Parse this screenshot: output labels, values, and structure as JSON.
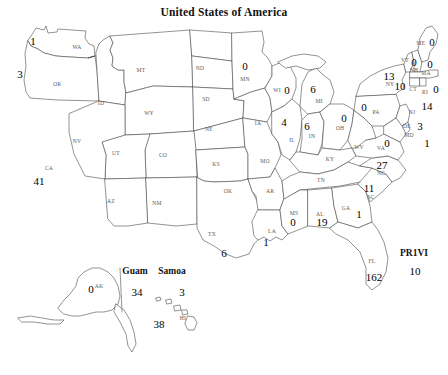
{
  "title": "United States of America",
  "chart_data": {
    "type": "map",
    "title": "United States of America",
    "subtitle": "",
    "xlabel": "",
    "ylabel": "",
    "legend": "none",
    "grid": false,
    "region_field": "state_abbreviation",
    "value_field": "count",
    "regions": [
      {
        "abbr": "WA",
        "label": "WA",
        "value": 1,
        "lx": 77,
        "ly": 47,
        "vx": 33,
        "vy": 41
      },
      {
        "abbr": "OR",
        "label": "OR",
        "value": 3,
        "lx": 57,
        "ly": 84,
        "vx": 20,
        "vy": 74
      },
      {
        "abbr": "CA",
        "label": "CA",
        "value": 41,
        "lx": 49,
        "ly": 168,
        "vx": 39,
        "vy": 181
      },
      {
        "abbr": "NV",
        "label": "NV",
        "value": null,
        "lx": 77,
        "ly": 141,
        "vx": null,
        "vy": null
      },
      {
        "abbr": "ID",
        "label": "ID",
        "value": null,
        "lx": 101,
        "ly": 103,
        "vx": null,
        "vy": null
      },
      {
        "abbr": "MT",
        "label": "MT",
        "value": null,
        "lx": 141,
        "ly": 70,
        "vx": null,
        "vy": null
      },
      {
        "abbr": "WY",
        "label": "WY",
        "value": null,
        "lx": 149,
        "ly": 113,
        "vx": null,
        "vy": null
      },
      {
        "abbr": "UT",
        "label": "UT",
        "value": null,
        "lx": 116,
        "ly": 153,
        "vx": null,
        "vy": null
      },
      {
        "abbr": "AZ",
        "label": "AZ",
        "value": null,
        "lx": 111,
        "ly": 201,
        "vx": null,
        "vy": null
      },
      {
        "abbr": "NM",
        "label": "NM",
        "value": null,
        "lx": 157,
        "ly": 203,
        "vx": null,
        "vy": null
      },
      {
        "abbr": "CO",
        "label": "CO",
        "value": null,
        "lx": 163,
        "ly": 155,
        "vx": null,
        "vy": null
      },
      {
        "abbr": "ND",
        "label": "ND",
        "value": null,
        "lx": 200,
        "ly": 68,
        "vx": null,
        "vy": null
      },
      {
        "abbr": "SD",
        "label": "SD",
        "value": null,
        "lx": 206,
        "ly": 99,
        "vx": null,
        "vy": null
      },
      {
        "abbr": "NE",
        "label": "NE",
        "value": null,
        "lx": 209,
        "ly": 129,
        "vx": null,
        "vy": null
      },
      {
        "abbr": "KS",
        "label": "KS",
        "value": null,
        "lx": 216,
        "ly": 164,
        "vx": null,
        "vy": null
      },
      {
        "abbr": "OK",
        "label": "OK",
        "value": null,
        "lx": 228,
        "ly": 191,
        "vx": null,
        "vy": null
      },
      {
        "abbr": "TX",
        "label": "TX",
        "value": 6,
        "lx": 212,
        "ly": 234,
        "vx": 224,
        "vy": 253
      },
      {
        "abbr": "MN",
        "label": "MN",
        "value": 0,
        "lx": 245,
        "ly": 79,
        "vx": 245,
        "vy": 66
      },
      {
        "abbr": "IA",
        "label": "IA",
        "value": null,
        "lx": 258,
        "ly": 123,
        "vx": null,
        "vy": null
      },
      {
        "abbr": "MO",
        "label": "MO",
        "value": null,
        "lx": 265,
        "ly": 161,
        "vx": null,
        "vy": null
      },
      {
        "abbr": "AR",
        "label": "AR",
        "value": null,
        "lx": 270,
        "ly": 191,
        "vx": null,
        "vy": null
      },
      {
        "abbr": "LA",
        "label": "LA",
        "value": 1,
        "lx": 272,
        "ly": 231,
        "vx": 266,
        "vy": 242
      },
      {
        "abbr": "WI",
        "label": "WI",
        "value": 0,
        "lx": 277,
        "ly": 90,
        "vx": 287,
        "vy": 90
      },
      {
        "abbr": "IL",
        "label": "IL",
        "value": 4,
        "lx": 292,
        "ly": 140,
        "vx": 284,
        "vy": 122
      },
      {
        "abbr": "MI",
        "label": "MI",
        "value": 6,
        "lx": 319,
        "ly": 101,
        "vx": 313,
        "vy": 89
      },
      {
        "abbr": "IN",
        "label": "IN",
        "value": 6,
        "lx": 312,
        "ly": 136,
        "vx": 307,
        "vy": 126
      },
      {
        "abbr": "OH",
        "label": "OH",
        "value": 0,
        "lx": 340,
        "ly": 128,
        "vx": 344,
        "vy": 118
      },
      {
        "abbr": "KY",
        "label": "KY",
        "value": null,
        "lx": 330,
        "ly": 159,
        "vx": null,
        "vy": null
      },
      {
        "abbr": "TN",
        "label": "TN",
        "value": null,
        "lx": 321,
        "ly": 180,
        "vx": null,
        "vy": null
      },
      {
        "abbr": "MS",
        "label": "MS",
        "value": 0,
        "lx": 294,
        "ly": 213,
        "vx": 293,
        "vy": 222
      },
      {
        "abbr": "AL",
        "label": "AL",
        "value": 19,
        "lx": 320,
        "ly": 214,
        "vx": 322,
        "vy": 222
      },
      {
        "abbr": "GA",
        "label": "GA",
        "value": 1,
        "lx": 346,
        "ly": 208,
        "vx": 359,
        "vy": 214
      },
      {
        "abbr": "FL",
        "label": "FL",
        "value": 162,
        "lx": 372,
        "ly": 261,
        "vx": 374,
        "vy": 277
      },
      {
        "abbr": "SC",
        "label": "SC",
        "value": 11,
        "lx": 371,
        "ly": 197,
        "vx": 369,
        "vy": 188
      },
      {
        "abbr": "NC",
        "label": "NC",
        "value": 27,
        "lx": 381,
        "ly": 173,
        "vx": 382,
        "vy": 165
      },
      {
        "abbr": "VA",
        "label": "VA",
        "value": 0,
        "lx": 381,
        "ly": 148,
        "vx": 387,
        "vy": 143
      },
      {
        "abbr": "WV",
        "label": "WV",
        "value": null,
        "lx": 359,
        "ly": 147,
        "vx": null,
        "vy": null
      },
      {
        "abbr": "PA",
        "label": "PA",
        "value": 0,
        "lx": 376,
        "ly": 112,
        "vx": 364,
        "vy": 107
      },
      {
        "abbr": "MD",
        "label": "MD",
        "value": 1,
        "lx": 409,
        "ly": 135,
        "vx": 427,
        "vy": 143
      },
      {
        "abbr": "DE",
        "label": "DE",
        "value": 3,
        "lx": 407,
        "ly": 126,
        "vx": 420,
        "vy": 126
      },
      {
        "abbr": "NJ",
        "label": "NJ",
        "value": 14,
        "lx": 412,
        "ly": 112,
        "vx": 427,
        "vy": 106
      },
      {
        "abbr": "NY",
        "label": "NY",
        "value": 13,
        "lx": 390,
        "ly": 84,
        "vx": 389,
        "vy": 76
      },
      {
        "abbr": "CT",
        "label": "CT",
        "value": 10,
        "lx": 413,
        "ly": 89,
        "vx": 400,
        "vy": 86
      },
      {
        "abbr": "RI",
        "label": "RI",
        "value": 0,
        "lx": 425,
        "ly": 92,
        "vx": 436,
        "vy": 89
      },
      {
        "abbr": "MA",
        "label": "MA",
        "value": 0,
        "lx": 426,
        "ly": 73,
        "vx": 430,
        "vy": 64
      },
      {
        "abbr": "NH",
        "label": "NH",
        "value": 0,
        "lx": 414,
        "ly": 70,
        "vx": 414,
        "vy": 62
      },
      {
        "abbr": "VT",
        "label": "VT",
        "value": null,
        "lx": 405,
        "ly": 60,
        "vx": null,
        "vy": null
      },
      {
        "abbr": "ME",
        "label": "ME",
        "value": 0,
        "lx": 421,
        "ly": 43,
        "vx": 432,
        "vy": 42
      },
      {
        "abbr": "AK",
        "label": "AK",
        "value": 0,
        "lx": 99,
        "ly": 286,
        "vx": 91,
        "vy": 289
      },
      {
        "abbr": "HI",
        "label": "HI",
        "value": 38,
        "lx": 183,
        "ly": 318,
        "vx": 159,
        "vy": 324
      }
    ],
    "territories": [
      {
        "name": "Guam",
        "value": 34,
        "nx": 135,
        "ny": 271,
        "vx": 137,
        "vy": 292
      },
      {
        "name": "Samoa",
        "value": 3,
        "nx": 172,
        "ny": 271,
        "vx": 182,
        "vy": 292
      },
      {
        "name": "PR1VI",
        "value": 10,
        "nx": 414,
        "ny": 253,
        "vx": 415,
        "vy": 271
      }
    ],
    "values_summary": {
      "WA": 1,
      "OR": 3,
      "CA": 41,
      "TX": 6,
      "MN": 0,
      "WI": 0,
      "MI": 6,
      "IL": 4,
      "IN": 6,
      "OH": 0,
      "LA": 1,
      "MS": 0,
      "AL": 19,
      "GA": 1,
      "FL": 162,
      "SC": 11,
      "NC": 27,
      "VA": 0,
      "PA": 0,
      "MD": 1,
      "DE": 3,
      "NJ": 14,
      "NY": 13,
      "CT": 10,
      "RI": 0,
      "MA": 0,
      "NH": 0,
      "ME": 0,
      "AK": 0,
      "HI": 38,
      "Guam": 34,
      "Samoa": 3,
      "PR1VI": 10
    }
  },
  "colors": {
    "background": "#ffffff",
    "outline": "#4a4a4a",
    "state_label": "#5a5a5a",
    "value_text": "#000000",
    "title": "#111111"
  }
}
